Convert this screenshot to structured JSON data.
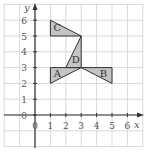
{
  "diagram": {
    "type": "coordinate-grid",
    "axes": {
      "x_label": "x",
      "y_label": "y",
      "x_ticks": [
        "0",
        "1",
        "2",
        "3",
        "4",
        "5",
        "6"
      ],
      "y_ticks": [
        "0",
        "1",
        "2",
        "3",
        "4",
        "5",
        "6"
      ],
      "x_range": [
        -2,
        7
      ],
      "y_range": [
        -2,
        7
      ]
    },
    "shapes": [
      {
        "label": "A",
        "vertices": [
          [
            1,
            2
          ],
          [
            1,
            3
          ],
          [
            3,
            3
          ]
        ]
      },
      {
        "label": "B",
        "vertices": [
          [
            3,
            3
          ],
          [
            5,
            3
          ],
          [
            5,
            2
          ]
        ]
      },
      {
        "label": "C",
        "vertices": [
          [
            1,
            5
          ],
          [
            1,
            6
          ],
          [
            3,
            5
          ]
        ]
      },
      {
        "label": "D",
        "vertices": [
          [
            2,
            3
          ],
          [
            3,
            5
          ],
          [
            3,
            3
          ]
        ]
      }
    ],
    "colors": {
      "fill": "#c4c4c4",
      "stroke": "#333333",
      "grid": "#cfcfcf",
      "axis": "#333333"
    }
  }
}
